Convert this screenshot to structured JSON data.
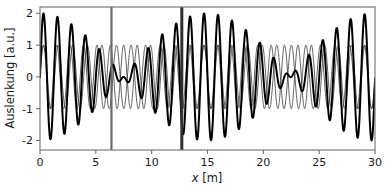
{
  "figure": {
    "background": "#ffffff",
    "frame_color": "#6f6f6f"
  },
  "chart_data": {
    "type": "line",
    "title": "",
    "subtitle": "",
    "xlabel": "x [m]",
    "xlabel_symbol": "x",
    "xlabel_unit": "[m]",
    "ylabel": "Auslenkung [a.u.]",
    "xlim": [
      0,
      30
    ],
    "ylim": [
      -2.3,
      2.2
    ],
    "xticks": [
      0,
      5,
      10,
      15,
      20,
      25,
      30
    ],
    "xticklabels": [
      "0",
      "5",
      "10",
      "15",
      "20",
      "25",
      "30"
    ],
    "yticks": [
      -2,
      -1,
      0,
      1,
      2
    ],
    "yticklabels": [
      "-2",
      "-1",
      "0",
      "1",
      "2"
    ],
    "grid": false,
    "legend": null,
    "legend_position": "none",
    "series": [
      {
        "name": "wave-1",
        "style": "thin",
        "color": "#2b2b2b",
        "linewidth": 0.75,
        "description": "constant amplitude sine, amplitude 1.0",
        "amplitude": 1.0,
        "wavelength": 1.2,
        "wavenumber": 5.236,
        "phase": 0.0
      },
      {
        "name": "wave-2",
        "style": "thin",
        "color": "#2b2b2b",
        "linewidth": 0.75,
        "description": "constant amplitude sine, slightly different wavelength",
        "amplitude": 1.0,
        "wavelength": 1.305,
        "wavenumber": 4.815,
        "phase": 0.0
      },
      {
        "name": "superposition",
        "style": "thick",
        "color": "#000000",
        "linewidth": 2.0,
        "description": "sum of wave-1 and wave-2, showing beats (Schwebung); amplitude envelope 0 to 2",
        "envelope_max": 2.0,
        "envelope_min": 0.0,
        "beat_nodes_x": [
          1.5,
          11.5,
          21.4
        ],
        "beat_antinodes_x": [
          6.4,
          16.4,
          26.4
        ],
        "beat_period": 15.0
      }
    ],
    "annotations": [
      {
        "name": "marker-line-1",
        "type": "vline",
        "x": 6.4,
        "color": "#6b6b6b",
        "linewidth": 2.2,
        "label": ""
      },
      {
        "name": "marker-line-2",
        "type": "vline",
        "x": 12.7,
        "color": "#303030",
        "linewidth": 3.0,
        "label": ""
      }
    ]
  }
}
